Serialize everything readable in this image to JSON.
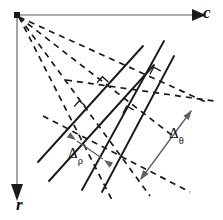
{
  "figure": {
    "kind": "geometry-diagram",
    "title_text": "",
    "background_color": "#ffffff",
    "ink_color": "#1a1a1a",
    "axis_color": "#5a5a5a",
    "measure_color": "#5e5e5e",
    "width": 223,
    "height": 220
  },
  "axes": {
    "origin": {
      "x": 17,
      "y": 15
    },
    "horizontal": {
      "label": "c",
      "icon": "arrow-right-icon",
      "from": {
        "x": 17,
        "y": 15
      },
      "to": {
        "x": 196,
        "y": 15
      }
    },
    "vertical": {
      "label": "r",
      "icon": "arrow-down-icon",
      "from": {
        "x": 17,
        "y": 15
      },
      "to": {
        "x": 17,
        "y": 192
      }
    }
  },
  "measures": {
    "rho": {
      "label": "Δ",
      "subscript": "ρ",
      "name": "delta-rho",
      "arrow": {
        "x1": 104,
        "y1": 160,
        "x2": 76,
        "y2": 140
      },
      "double_headed": true
    },
    "theta": {
      "label": "Δ",
      "subscript": "θ",
      "name": "delta-theta",
      "arrow": {
        "x1": 140,
        "y1": 180,
        "x2": 192,
        "y2": 110
      },
      "double_headed": true
    }
  },
  "rays_from_origin": [
    {
      "name": "ray-1",
      "to": {
        "x": 112,
        "y": 200
      }
    },
    {
      "name": "ray-2",
      "to": {
        "x": 150,
        "y": 196
      }
    },
    {
      "name": "ray-3",
      "to": {
        "x": 173,
        "y": 136
      }
    },
    {
      "name": "ray-4",
      "to": {
        "x": 206,
        "y": 104
      }
    }
  ],
  "solid_lines": [
    {
      "name": "line-a1",
      "x1": 40,
      "y1": 160,
      "x2": 142,
      "y2": 47
    },
    {
      "name": "line-a2",
      "x1": 50,
      "y1": 180,
      "x2": 152,
      "y2": 67
    },
    {
      "name": "line-b1",
      "x1": 83,
      "y1": 188,
      "x2": 163,
      "y2": 42
    },
    {
      "name": "line-b2",
      "x1": 101,
      "y1": 190,
      "x2": 172,
      "y2": 57
    }
  ],
  "dashed_segments": [
    {
      "name": "dash-perp-1",
      "x1": 46,
      "y1": 120,
      "x2": 186,
      "y2": 190
    },
    {
      "name": "dash-perp-2",
      "x1": 70,
      "y1": 84,
      "x2": 210,
      "y2": 102
    }
  ],
  "right_angle_markers": [
    {
      "name": "right-angle-1",
      "x": 78,
      "y": 112,
      "rotation": -48
    },
    {
      "name": "right-angle-2",
      "x": 101,
      "y": 88,
      "rotation": -48
    },
    {
      "name": "right-angle-3",
      "x": 128,
      "y": 117,
      "rotation": -62
    },
    {
      "name": "right-angle-4",
      "x": 155,
      "y": 78,
      "rotation": -62
    }
  ]
}
